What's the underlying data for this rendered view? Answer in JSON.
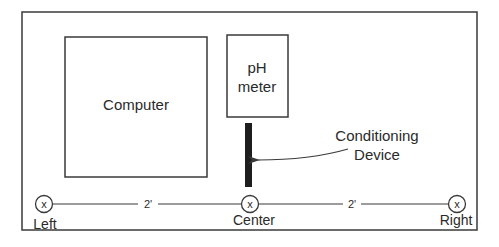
{
  "diagram": {
    "components": {
      "computer": {
        "label": "Computer"
      },
      "ph_meter": {
        "label_line1": "pH",
        "label_line2": "meter"
      },
      "conditioning_device": {
        "label_line1": "Conditioning",
        "label_line2": "Device"
      }
    },
    "positions": {
      "left": {
        "label": "Left",
        "marker": "x"
      },
      "center": {
        "label": "Center",
        "marker": "x"
      },
      "right": {
        "label": "Right",
        "marker": "x"
      }
    },
    "distances": {
      "left_to_center": "2'",
      "center_to_right": "2'"
    },
    "colors": {
      "stroke": "#3a3a3a",
      "device_fill": "#1e1e1e",
      "background": "#ffffff"
    }
  }
}
